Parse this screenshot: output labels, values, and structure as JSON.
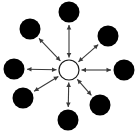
{
  "diagram": {
    "type": "radial-hub-and-spoke",
    "canvas": {
      "width": 139,
      "height": 132,
      "background": "#ffffff"
    },
    "hub": {
      "name": "center-hub",
      "cx": 69,
      "cy": 70,
      "r": 10,
      "fill": "#ffffff",
      "stroke": "#1a1a1a",
      "stroke_width": 1.2,
      "label": ""
    },
    "node_style": {
      "fill": "#000000",
      "r": 10.5
    },
    "arrow_style": {
      "stroke": "#3a3a3a",
      "stroke_width": 1.1,
      "heads": "both",
      "head_length": 4.5,
      "head_halfwidth": 2.3
    },
    "nodes": [
      {
        "name": "node-n",
        "direction": "north",
        "angle_deg": 270,
        "cx": 69,
        "cy": 12,
        "r": 10.5,
        "label": ""
      },
      {
        "name": "node-ne",
        "direction": "north-east",
        "angle_deg": 315,
        "cx": 108,
        "cy": 36,
        "r": 10.5,
        "label": ""
      },
      {
        "name": "node-e",
        "direction": "east",
        "angle_deg": 0,
        "cx": 124,
        "cy": 70,
        "r": 10.5,
        "label": ""
      },
      {
        "name": "node-se",
        "direction": "south-east",
        "angle_deg": 45,
        "cx": 100,
        "cy": 105,
        "r": 10.5,
        "label": ""
      },
      {
        "name": "node-s",
        "direction": "south",
        "angle_deg": 90,
        "cx": 68,
        "cy": 120,
        "r": 10.5,
        "label": ""
      },
      {
        "name": "node-sw",
        "direction": "south-west",
        "angle_deg": 135,
        "cx": 23,
        "cy": 98,
        "r": 10.5,
        "label": ""
      },
      {
        "name": "node-w",
        "direction": "west",
        "angle_deg": 180,
        "cx": 14,
        "cy": 69,
        "r": 10.5,
        "label": ""
      },
      {
        "name": "node-nw",
        "direction": "north-west",
        "angle_deg": 225,
        "cx": 30,
        "cy": 29,
        "r": 10.5,
        "label": ""
      }
    ],
    "connections": [
      {
        "name": "arrow-hub-n",
        "from": "center-hub",
        "to": "node-n",
        "bidirectional": true
      },
      {
        "name": "arrow-hub-ne",
        "from": "center-hub",
        "to": "node-ne",
        "bidirectional": true
      },
      {
        "name": "arrow-hub-e",
        "from": "center-hub",
        "to": "node-e",
        "bidirectional": true
      },
      {
        "name": "arrow-hub-se",
        "from": "center-hub",
        "to": "node-se",
        "bidirectional": true
      },
      {
        "name": "arrow-hub-s",
        "from": "center-hub",
        "to": "node-s",
        "bidirectional": true
      },
      {
        "name": "arrow-hub-sw",
        "from": "center-hub",
        "to": "node-sw",
        "bidirectional": true
      },
      {
        "name": "arrow-hub-w",
        "from": "center-hub",
        "to": "node-w",
        "bidirectional": true
      },
      {
        "name": "arrow-hub-nw",
        "from": "center-hub",
        "to": "node-nw",
        "bidirectional": true
      }
    ]
  }
}
